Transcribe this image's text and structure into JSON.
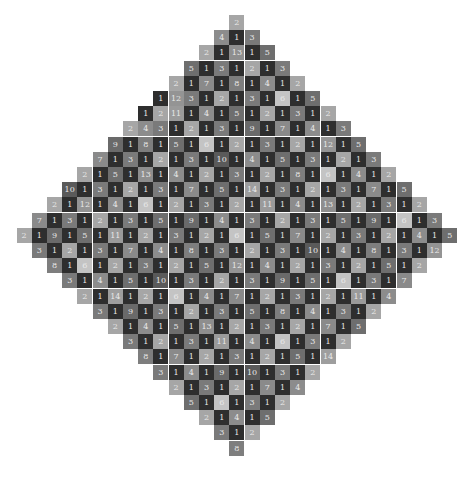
{
  "puzzle": {
    "shape": "diamond",
    "rows": [
      [
        2
      ],
      [
        4,
        1,
        3
      ],
      [
        2,
        1,
        13,
        1,
        5
      ],
      [
        5,
        1,
        3,
        1,
        2,
        1,
        3
      ],
      [
        2,
        1,
        7,
        1,
        8,
        1,
        4,
        1,
        2
      ],
      [
        1,
        12,
        3,
        1,
        2,
        1,
        3,
        1,
        6,
        1,
        5
      ],
      [
        1,
        2,
        11,
        1,
        4,
        1,
        5,
        1,
        2,
        1,
        3,
        1,
        2
      ],
      [
        2,
        4,
        3,
        1,
        2,
        1,
        3,
        1,
        9,
        1,
        7,
        1,
        4,
        1,
        3
      ],
      [
        9,
        1,
        8,
        1,
        5,
        1,
        6,
        1,
        2,
        1,
        3,
        1,
        2,
        1,
        12,
        1,
        5
      ],
      [
        7,
        1,
        3,
        1,
        2,
        1,
        3,
        1,
        10,
        1,
        4,
        1,
        5,
        1,
        3,
        1,
        2,
        1,
        3
      ],
      [
        2,
        1,
        5,
        1,
        13,
        1,
        4,
        1,
        2,
        1,
        3,
        1,
        2,
        1,
        8,
        1,
        6,
        1,
        4,
        1,
        2
      ],
      [
        10,
        1,
        3,
        1,
        2,
        1,
        3,
        1,
        7,
        1,
        5,
        1,
        14,
        1,
        3,
        1,
        2,
        1,
        3,
        1,
        7,
        1,
        5
      ],
      [
        2,
        1,
        12,
        1,
        4,
        1,
        6,
        1,
        2,
        1,
        3,
        1,
        2,
        1,
        11,
        1,
        4,
        1,
        13,
        1,
        2,
        1,
        3,
        1,
        2
      ],
      [
        7,
        1,
        3,
        1,
        2,
        1,
        3,
        1,
        5,
        1,
        9,
        1,
        4,
        1,
        3,
        1,
        2,
        1,
        3,
        1,
        5,
        1,
        9,
        1,
        6,
        1,
        3
      ],
      [
        2,
        1,
        9,
        1,
        5,
        1,
        11,
        1,
        2,
        1,
        3,
        1,
        2,
        1,
        6,
        1,
        5,
        1,
        7,
        1,
        2,
        1,
        3,
        1,
        2,
        1,
        4,
        1,
        5
      ],
      [
        3,
        1,
        2,
        1,
        3,
        1,
        7,
        1,
        4,
        1,
        8,
        1,
        3,
        1,
        2,
        1,
        3,
        1,
        10,
        1,
        4,
        1,
        8,
        1,
        3,
        1,
        12
      ],
      [
        8,
        1,
        6,
        1,
        2,
        1,
        3,
        1,
        2,
        1,
        5,
        1,
        12,
        1,
        4,
        1,
        2,
        1,
        3,
        1,
        2,
        1,
        5,
        1,
        2
      ],
      [
        3,
        1,
        4,
        1,
        5,
        1,
        10,
        1,
        3,
        1,
        2,
        1,
        3,
        1,
        9,
        1,
        5,
        1,
        6,
        1,
        3,
        1,
        7
      ],
      [
        2,
        1,
        14,
        1,
        2,
        1,
        6,
        1,
        4,
        1,
        7,
        1,
        2,
        1,
        3,
        1,
        2,
        1,
        11,
        1,
        4
      ],
      [
        3,
        1,
        9,
        1,
        3,
        1,
        2,
        1,
        3,
        1,
        5,
        1,
        8,
        1,
        4,
        1,
        3,
        1,
        2
      ],
      [
        2,
        1,
        4,
        1,
        5,
        1,
        13,
        1,
        2,
        1,
        3,
        1,
        2,
        1,
        7,
        1,
        5
      ],
      [
        3,
        1,
        2,
        1,
        3,
        1,
        11,
        1,
        4,
        1,
        6,
        1,
        3,
        1,
        2
      ],
      [
        8,
        1,
        7,
        1,
        2,
        1,
        3,
        1,
        2,
        1,
        5,
        1,
        14
      ],
      [
        3,
        1,
        4,
        1,
        9,
        1,
        10,
        1,
        3,
        1,
        2
      ],
      [
        2,
        1,
        3,
        1,
        2,
        1,
        7,
        1,
        4
      ],
      [
        5,
        1,
        6,
        1,
        3,
        1,
        2
      ],
      [
        2,
        1,
        4,
        1,
        5
      ],
      [
        3,
        1,
        2
      ],
      [
        8
      ]
    ],
    "colors": {
      "1": "#2e2e2e",
      "2": "#a6a6a6",
      "3": "#7a7a7a",
      "4": "#8c8c8c",
      "5": "#6e6e6e",
      "6": "#c4c4c4",
      "7": "#8a8a8a",
      "8": "#7e7e7e",
      "9": "#6a6a6a",
      "10": "#5a5a5a",
      "11": "#9a9a9a",
      "12": "#949494",
      "13": "#8e8e8e",
      "14": "#9e9e9e"
    }
  }
}
